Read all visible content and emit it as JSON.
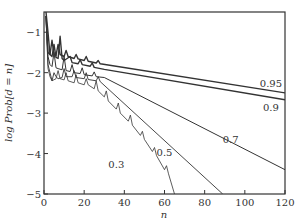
{
  "chart_data": {
    "type": "line",
    "title": "",
    "xlabel": "n",
    "ylabel": "log Prob[d = n]",
    "xlim": [
      0,
      120
    ],
    "ylim": [
      -5,
      -0.5
    ],
    "xticks": [
      0,
      20,
      40,
      60,
      80,
      100,
      120
    ],
    "yticks": [
      -1,
      -2,
      -3,
      -4,
      -5
    ],
    "grid": false,
    "legend": "inline labels at line ends",
    "series": [
      {
        "name": "0.95",
        "label_pos": [
          113,
          -2.35
        ],
        "points": [
          [
            1,
            -0.6
          ],
          [
            2,
            -1.5
          ],
          [
            3,
            -1.55
          ],
          [
            4,
            -1.2
          ],
          [
            5,
            -1.55
          ],
          [
            6,
            -1.58
          ],
          [
            7,
            -1.3
          ],
          [
            8,
            -1.55
          ],
          [
            10,
            -1.6
          ],
          [
            11,
            -1.45
          ],
          [
            12,
            -1.6
          ],
          [
            15,
            -1.65
          ],
          [
            16,
            -1.55
          ],
          [
            17,
            -1.66
          ],
          [
            20,
            -1.7
          ],
          [
            21,
            -1.6
          ],
          [
            22,
            -1.72
          ],
          [
            26,
            -1.76
          ],
          [
            27,
            -1.7
          ],
          [
            28,
            -1.78
          ],
          [
            120,
            -2.5
          ]
        ]
      },
      {
        "name": "0.9",
        "label_pos": [
          113,
          -2.95
        ],
        "points": [
          [
            1,
            -0.5
          ],
          [
            2,
            -1.0
          ],
          [
            3,
            -1.55
          ],
          [
            4,
            -1.6
          ],
          [
            5,
            -1.3
          ],
          [
            6,
            -1.62
          ],
          [
            7,
            -1.65
          ],
          [
            8,
            -1.1
          ],
          [
            9,
            -1.65
          ],
          [
            10,
            -1.7
          ],
          [
            13,
            -1.6
          ],
          [
            14,
            -1.75
          ],
          [
            17,
            -1.78
          ],
          [
            18,
            -1.68
          ],
          [
            19,
            -1.8
          ],
          [
            23,
            -1.84
          ],
          [
            24,
            -1.76
          ],
          [
            25,
            -1.87
          ],
          [
            30,
            -1.92
          ],
          [
            120,
            -2.67
          ]
        ]
      },
      {
        "name": "0.7",
        "label_pos": [
          93,
          -3.75
        ],
        "points": [
          [
            1,
            -0.6
          ],
          [
            2,
            -1.6
          ],
          [
            3,
            -1.8
          ],
          [
            4,
            -1.85
          ],
          [
            5,
            -1.5
          ],
          [
            6,
            -1.88
          ],
          [
            7,
            -1.9
          ],
          [
            9,
            -1.93
          ],
          [
            10,
            -1.6
          ],
          [
            11,
            -1.95
          ],
          [
            13,
            -1.97
          ],
          [
            14,
            -1.8
          ],
          [
            15,
            -2.0
          ],
          [
            18,
            -2.02
          ],
          [
            19,
            -1.88
          ],
          [
            20,
            -2.05
          ],
          [
            24,
            -2.08
          ],
          [
            25,
            -1.98
          ],
          [
            26,
            -2.1
          ],
          [
            30,
            -2.12
          ],
          [
            120,
            -4.4
          ]
        ]
      },
      {
        "name": "0.5",
        "label_pos": [
          60,
          -4.05
        ],
        "points": [
          [
            1,
            -0.6
          ],
          [
            2,
            -1.8
          ],
          [
            3,
            -2.0
          ],
          [
            4,
            -2.2
          ],
          [
            5,
            -2.0
          ],
          [
            6,
            -2.1
          ],
          [
            7,
            -2.15
          ],
          [
            9,
            -2.12
          ],
          [
            10,
            -1.9
          ],
          [
            11,
            -2.1
          ],
          [
            14,
            -2.1
          ],
          [
            15,
            -1.95
          ],
          [
            16,
            -2.12
          ],
          [
            20,
            -2.15
          ],
          [
            21,
            -2.0
          ],
          [
            22,
            -2.17
          ],
          [
            26,
            -2.2
          ],
          [
            27,
            -2.1
          ],
          [
            28,
            -2.22
          ],
          [
            89,
            -5.0
          ]
        ]
      },
      {
        "name": "0.3",
        "label_pos": [
          36,
          -4.35
        ],
        "points": [
          [
            1,
            -0.6
          ],
          [
            2,
            -1.9
          ],
          [
            3,
            -2.1
          ],
          [
            4,
            -2.2
          ],
          [
            6,
            -2.15
          ],
          [
            7,
            -1.95
          ],
          [
            8,
            -2.15
          ],
          [
            10,
            -2.18
          ],
          [
            11,
            -2.0
          ],
          [
            12,
            -2.2
          ],
          [
            15,
            -2.25
          ],
          [
            16,
            -2.05
          ],
          [
            17,
            -2.25
          ],
          [
            20,
            -2.3
          ],
          [
            21,
            -2.15
          ],
          [
            22,
            -2.3
          ],
          [
            25,
            -2.4
          ],
          [
            26,
            -2.2
          ],
          [
            27,
            -2.45
          ],
          [
            30,
            -2.6
          ],
          [
            31,
            -2.45
          ],
          [
            32,
            -2.7
          ],
          [
            36,
            -2.9
          ],
          [
            37,
            -2.75
          ],
          [
            38,
            -3.0
          ],
          [
            42,
            -3.2
          ],
          [
            43,
            -3.05
          ],
          [
            44,
            -3.3
          ],
          [
            48,
            -3.55
          ],
          [
            49,
            -3.45
          ],
          [
            50,
            -3.65
          ],
          [
            54,
            -3.95
          ],
          [
            55,
            -3.85
          ],
          [
            56,
            -4.05
          ],
          [
            60,
            -4.4
          ],
          [
            61,
            -4.3
          ],
          [
            62,
            -4.5
          ],
          [
            65,
            -5.0
          ]
        ]
      }
    ]
  }
}
